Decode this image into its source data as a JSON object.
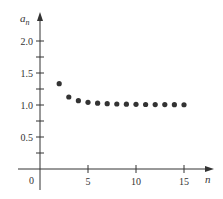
{
  "chart_data": {
    "type": "scatter",
    "title": "",
    "xlabel": "n",
    "ylabel": "a_n",
    "x": [
      2,
      3,
      4,
      5,
      6,
      7,
      8,
      9,
      10,
      11,
      12,
      13,
      14,
      15
    ],
    "values": [
      1.333,
      1.125,
      1.067,
      1.042,
      1.029,
      1.021,
      1.016,
      1.013,
      1.01,
      1.008,
      1.007,
      1.006,
      1.005,
      1.004
    ],
    "xlim": [
      0,
      17
    ],
    "ylim": [
      0,
      2.4
    ],
    "x_ticks": [
      5,
      10,
      15
    ],
    "x_tick_labels": [
      "5",
      "10",
      "15"
    ],
    "y_ticks": [
      0.25,
      0.5,
      0.75,
      1.0,
      1.25,
      1.5,
      1.75,
      2.0
    ],
    "y_tick_labels": [
      "0.5",
      "1.0",
      "1.5",
      "2.0"
    ],
    "origin_label": "0",
    "grid": false,
    "legend": null,
    "marker_color": "#333333"
  }
}
